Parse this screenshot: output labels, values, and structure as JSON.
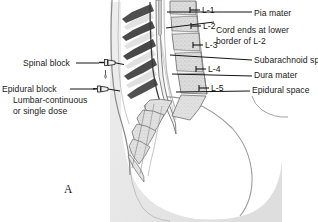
{
  "figure": {
    "panel_label": "A",
    "colors": {
      "background": "#ffffff",
      "ink": "#1a1a1a",
      "leader_line": "#1c1c1c",
      "spinous_process": "#4a4a4a",
      "vertebral_body": "#d8d8d8",
      "body_mass": "#e6e6e6",
      "body_outline": "#8f8f8f",
      "dural_sac": "#efefef"
    }
  },
  "right_labels": [
    {
      "id": "pia-mater",
      "text": "Pia mater"
    },
    {
      "id": "cord-ends-line-1",
      "text": "Cord ends at lower"
    },
    {
      "id": "cord-ends-line-2",
      "text": "border of L-2"
    },
    {
      "id": "subarachnoid",
      "text": "Subarachnoid space"
    },
    {
      "id": "dura-mater",
      "text": "Dura mater"
    },
    {
      "id": "epidural-space",
      "text": "Epidural space"
    }
  ],
  "vertebra_labels": [
    {
      "id": "l1",
      "text": "L-1"
    },
    {
      "id": "l2",
      "text": "L-2"
    },
    {
      "id": "l3",
      "text": "L-3"
    },
    {
      "id": "l4",
      "text": "L-4"
    },
    {
      "id": "l5",
      "text": "L-5"
    }
  ],
  "left_labels": {
    "spinal_block": "Spinal block",
    "epidural_block": "Epidural block",
    "epidural_detail_line_1": "Lumbar-continuous",
    "epidural_detail_line_2": "or single dose"
  },
  "icons": {
    "spinal_needle": "spinal-needle-icon",
    "epidural_needle": "epidural-needle-icon",
    "fluid_drop": "fluid-drop-icon"
  }
}
